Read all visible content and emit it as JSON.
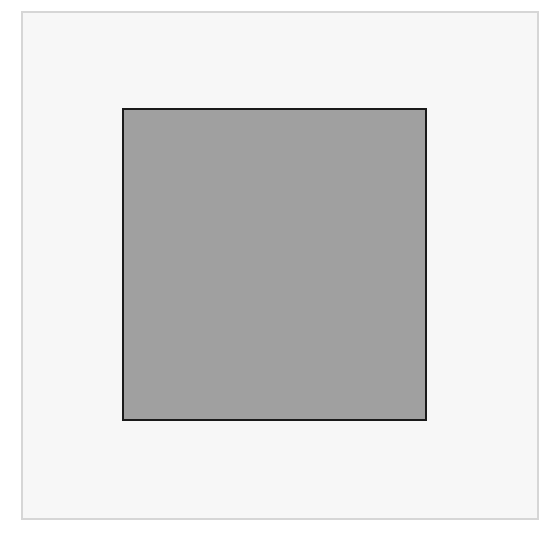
{
  "diagram": {
    "frame": {
      "label": "outer frame",
      "fill_color": "#f7f7f7",
      "border_color": "#d6d6d6"
    },
    "shape": {
      "type": "square",
      "label": "gray square",
      "fill_color": "#a0a0a0",
      "border_color": "#1a1a1a"
    }
  }
}
